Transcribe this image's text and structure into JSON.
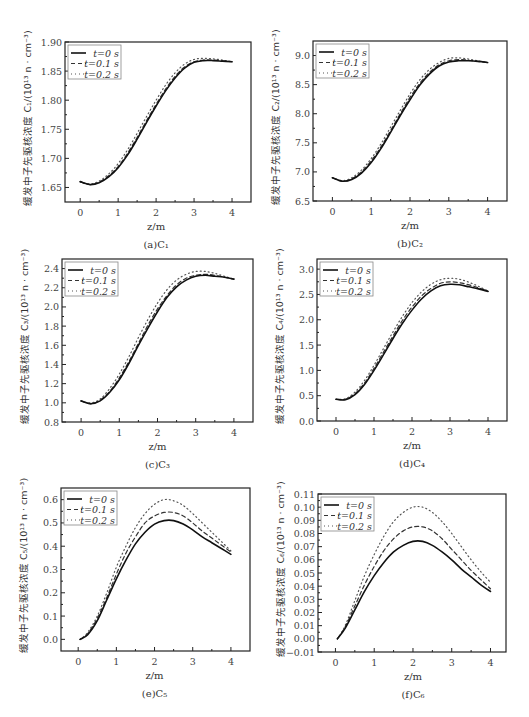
{
  "figure": {
    "legend": [
      {
        "label": "t=0 s",
        "style": "solid"
      },
      {
        "label": "t=0.1 s",
        "style": "dashed"
      },
      {
        "label": "t=0.2 s",
        "style": "dotted"
      }
    ],
    "xlabel": "z/m",
    "ylabel_prefix": "缓发中子先驱核浓度",
    "ylabel_unit": "/(10¹³ n · cm⁻³)"
  },
  "chart_data": [
    {
      "id": "a",
      "caption": "(a)C₁",
      "symbol": "C₁",
      "type": "line",
      "title": "",
      "xlabel": "z/m",
      "ylabel": "缓发中子先驱核浓度 C₁/(10¹³ n·cm⁻³)",
      "xlim": [
        -0.4,
        4.5
      ],
      "ylim": [
        1.625,
        1.9
      ],
      "xticks": [
        0,
        1,
        2,
        3,
        4
      ],
      "yticks": [
        1.65,
        1.7,
        1.75,
        1.8,
        1.85,
        1.9
      ],
      "ytick_labels": [
        "1.65",
        "1.70",
        "1.75",
        "1.80",
        "1.85",
        "1.90"
      ],
      "frame": [
        65,
        42,
        251,
        202
      ],
      "x": [
        0,
        0.25,
        0.5,
        0.75,
        1.0,
        1.25,
        1.5,
        1.75,
        2.0,
        2.25,
        2.5,
        2.75,
        3.0,
        3.25,
        3.5,
        3.75,
        4.0
      ],
      "series": [
        {
          "name": "t=0 s",
          "values": [
            1.66,
            1.655,
            1.658,
            1.668,
            1.684,
            1.706,
            1.733,
            1.762,
            1.79,
            1.816,
            1.838,
            1.855,
            1.865,
            1.868,
            1.868,
            1.867,
            1.866
          ]
        },
        {
          "name": "t=0.1 s",
          "values": [
            1.66,
            1.655,
            1.659,
            1.67,
            1.686,
            1.709,
            1.736,
            1.765,
            1.793,
            1.819,
            1.841,
            1.857,
            1.866,
            1.869,
            1.869,
            1.868,
            1.866
          ]
        },
        {
          "name": "t=0.2 s",
          "values": [
            1.66,
            1.656,
            1.661,
            1.673,
            1.691,
            1.715,
            1.743,
            1.772,
            1.8,
            1.826,
            1.847,
            1.862,
            1.87,
            1.872,
            1.871,
            1.869,
            1.866
          ]
        }
      ]
    },
    {
      "id": "b",
      "caption": "(b)C₂",
      "symbol": "C₂",
      "type": "line",
      "title": "",
      "xlabel": "z/m",
      "ylabel": "缓发中子先驱核浓度 C₂/(10¹³ n·cm⁻³)",
      "xlim": [
        -0.5,
        4.5
      ],
      "ylim": [
        6.5,
        9.25
      ],
      "xticks": [
        0,
        1,
        2,
        3,
        4
      ],
      "yticks": [
        6.5,
        7.0,
        7.5,
        8.0,
        8.5,
        9.0
      ],
      "ytick_labels": [
        "6.5",
        "7.0",
        "7.5",
        "8.0",
        "8.5",
        "9.0"
      ],
      "frame": [
        313,
        41,
        507,
        201
      ],
      "x": [
        0,
        0.25,
        0.5,
        0.75,
        1.0,
        1.25,
        1.5,
        1.75,
        2.0,
        2.25,
        2.5,
        2.75,
        3.0,
        3.25,
        3.5,
        3.75,
        4.0
      ],
      "series": [
        {
          "name": "t=0 s",
          "values": [
            6.9,
            6.84,
            6.87,
            6.98,
            7.16,
            7.4,
            7.68,
            7.97,
            8.24,
            8.49,
            8.68,
            8.82,
            8.89,
            8.91,
            8.91,
            8.9,
            8.88
          ]
        },
        {
          "name": "t=0.1 s",
          "values": [
            6.9,
            6.84,
            6.88,
            7.0,
            7.19,
            7.43,
            7.71,
            8.0,
            8.28,
            8.52,
            8.71,
            8.84,
            8.91,
            8.93,
            8.92,
            8.9,
            8.88
          ]
        },
        {
          "name": "t=0.2 s",
          "values": [
            6.9,
            6.85,
            6.9,
            7.03,
            7.23,
            7.48,
            7.77,
            8.06,
            8.34,
            8.58,
            8.76,
            8.88,
            8.95,
            8.96,
            8.94,
            8.91,
            8.88
          ]
        }
      ]
    },
    {
      "id": "c",
      "caption": "(c)C₃",
      "symbol": "C₃",
      "type": "line",
      "title": "",
      "xlabel": "z/m",
      "ylabel": "缓发中子先驱核浓度 C₃/(10¹³ n·cm⁻³)",
      "xlim": [
        -0.5,
        4.5
      ],
      "ylim": [
        0.8,
        2.5
      ],
      "xticks": [
        0,
        1,
        2,
        3,
        4
      ],
      "yticks": [
        0.8,
        1.0,
        1.2,
        1.4,
        1.6,
        1.8,
        2.0,
        2.2,
        2.4
      ],
      "ytick_labels": [
        "0.8",
        "1.0",
        "1.2",
        "1.4",
        "1.6",
        "1.8",
        "2.0",
        "2.2",
        "2.4"
      ],
      "frame": [
        62,
        259,
        253,
        422
      ],
      "x": [
        0,
        0.25,
        0.5,
        0.75,
        1.0,
        1.25,
        1.5,
        1.75,
        2.0,
        2.25,
        2.5,
        2.75,
        3.0,
        3.25,
        3.5,
        3.75,
        4.0
      ],
      "series": [
        {
          "name": "t=0 s",
          "values": [
            1.02,
            0.99,
            1.02,
            1.11,
            1.24,
            1.41,
            1.6,
            1.78,
            1.95,
            2.1,
            2.21,
            2.28,
            2.32,
            2.33,
            2.32,
            2.31,
            2.29
          ]
        },
        {
          "name": "t=0.1 s",
          "values": [
            1.02,
            0.99,
            1.03,
            1.12,
            1.26,
            1.43,
            1.62,
            1.81,
            1.98,
            2.12,
            2.23,
            2.3,
            2.33,
            2.34,
            2.33,
            2.31,
            2.29
          ]
        },
        {
          "name": "t=0.2 s",
          "values": [
            1.02,
            1.0,
            1.04,
            1.15,
            1.3,
            1.48,
            1.68,
            1.87,
            2.04,
            2.18,
            2.28,
            2.34,
            2.37,
            2.37,
            2.35,
            2.32,
            2.29
          ]
        }
      ]
    },
    {
      "id": "d",
      "caption": "(d)C₄",
      "symbol": "C₄",
      "type": "line",
      "title": "",
      "xlabel": "z/m",
      "ylabel": "缓发中子先驱核浓度 C₄/(10¹³ n·cm⁻³)",
      "xlim": [
        -0.5,
        4.5
      ],
      "ylim": [
        0.0,
        3.2
      ],
      "xticks": [
        0,
        1,
        2,
        3,
        4
      ],
      "yticks": [
        0.0,
        0.5,
        1.0,
        1.5,
        2.0,
        2.5,
        3.0
      ],
      "ytick_labels": [
        "0.0",
        "0.5",
        "1.0",
        "1.5",
        "2.0",
        "2.5",
        "3.0"
      ],
      "frame": [
        317,
        259,
        507,
        421
      ],
      "x": [
        0,
        0.25,
        0.5,
        0.75,
        1.0,
        1.25,
        1.5,
        1.75,
        2.0,
        2.25,
        2.5,
        2.75,
        3.0,
        3.25,
        3.5,
        3.75,
        4.0
      ],
      "series": [
        {
          "name": "t=0 s",
          "values": [
            0.43,
            0.42,
            0.52,
            0.72,
            1.0,
            1.31,
            1.63,
            1.93,
            2.19,
            2.41,
            2.57,
            2.67,
            2.7,
            2.69,
            2.65,
            2.61,
            2.56
          ]
        },
        {
          "name": "t=0.1 s",
          "values": [
            0.43,
            0.43,
            0.54,
            0.75,
            1.04,
            1.36,
            1.68,
            1.99,
            2.25,
            2.47,
            2.62,
            2.72,
            2.75,
            2.73,
            2.69,
            2.63,
            2.56
          ]
        },
        {
          "name": "t=0.2 s",
          "values": [
            0.43,
            0.44,
            0.57,
            0.8,
            1.1,
            1.43,
            1.76,
            2.07,
            2.34,
            2.55,
            2.7,
            2.79,
            2.82,
            2.8,
            2.74,
            2.66,
            2.57
          ]
        }
      ]
    },
    {
      "id": "e",
      "caption": "(e)C₅",
      "symbol": "C₅",
      "type": "line",
      "title": "",
      "xlabel": "z/m",
      "ylabel": "缓发中子先驱核浓度 C₅/(10¹³ n·cm⁻³)",
      "xlim": [
        -0.45,
        4.5
      ],
      "ylim": [
        -0.05,
        0.65
      ],
      "xticks": [
        0,
        1,
        2,
        3,
        4
      ],
      "yticks": [
        0.0,
        0.1,
        0.2,
        0.3,
        0.4,
        0.5,
        0.6
      ],
      "ytick_labels": [
        "0.0",
        "0.1",
        "0.2",
        "0.3",
        "0.4",
        "0.5",
        "0.6"
      ],
      "frame": [
        61,
        488,
        250,
        651
      ],
      "x": [
        0.05,
        0.25,
        0.5,
        0.75,
        1.0,
        1.25,
        1.5,
        1.75,
        2.0,
        2.25,
        2.5,
        2.75,
        3.0,
        3.25,
        3.5,
        3.75,
        4.0
      ],
      "series": [
        {
          "name": "t=0 s",
          "values": [
            0.0,
            0.02,
            0.08,
            0.17,
            0.26,
            0.34,
            0.41,
            0.46,
            0.495,
            0.51,
            0.51,
            0.495,
            0.47,
            0.44,
            0.415,
            0.39,
            0.365
          ]
        },
        {
          "name": "t=0.1 s",
          "values": [
            0.0,
            0.025,
            0.09,
            0.18,
            0.28,
            0.37,
            0.44,
            0.5,
            0.53,
            0.545,
            0.545,
            0.53,
            0.5,
            0.465,
            0.435,
            0.405,
            0.375
          ]
        },
        {
          "name": "t=0.2 s",
          "values": [
            0.0,
            0.03,
            0.1,
            0.2,
            0.31,
            0.4,
            0.48,
            0.54,
            0.58,
            0.6,
            0.595,
            0.575,
            0.54,
            0.5,
            0.46,
            0.42,
            0.38
          ]
        }
      ]
    },
    {
      "id": "f",
      "caption": "(f)C₆",
      "symbol": "C₆",
      "type": "line",
      "title": "",
      "xlabel": "z/m",
      "ylabel": "缓发中子先驱核浓度 C₆/(10¹³ n·cm⁻³)",
      "xlim": [
        -0.45,
        4.4
      ],
      "ylim": [
        -0.01,
        0.11
      ],
      "xticks": [
        0,
        1,
        2,
        3,
        4
      ],
      "yticks": [
        -0.01,
        0.0,
        0.01,
        0.02,
        0.03,
        0.04,
        0.05,
        0.06,
        0.07,
        0.08,
        0.09,
        0.1,
        0.11
      ],
      "ytick_labels": [
        "−0.01",
        "0.00",
        "0.01",
        "0.02",
        "0.03",
        "0.04",
        "0.05",
        "0.06",
        "0.07",
        "0.08",
        "0.09",
        "0.10",
        "0.11"
      ],
      "frame": [
        318,
        494,
        506,
        652
      ],
      "x": [
        0.05,
        0.25,
        0.5,
        0.75,
        1.0,
        1.25,
        1.5,
        1.75,
        2.0,
        2.25,
        2.5,
        2.75,
        3.0,
        3.25,
        3.5,
        3.75,
        4.0
      ],
      "series": [
        {
          "name": "t=0 s",
          "values": [
            0.0,
            0.008,
            0.022,
            0.036,
            0.048,
            0.058,
            0.066,
            0.071,
            0.074,
            0.074,
            0.071,
            0.066,
            0.06,
            0.053,
            0.047,
            0.041,
            0.036
          ]
        },
        {
          "name": "t=0.1 s",
          "values": [
            0.0,
            0.009,
            0.025,
            0.041,
            0.055,
            0.067,
            0.076,
            0.082,
            0.085,
            0.085,
            0.082,
            0.076,
            0.068,
            0.06,
            0.052,
            0.045,
            0.038
          ]
        },
        {
          "name": "t=0.2 s",
          "values": [
            0.0,
            0.01,
            0.029,
            0.048,
            0.064,
            0.078,
            0.089,
            0.096,
            0.1,
            0.1,
            0.096,
            0.089,
            0.08,
            0.07,
            0.06,
            0.051,
            0.043
          ]
        }
      ]
    }
  ]
}
